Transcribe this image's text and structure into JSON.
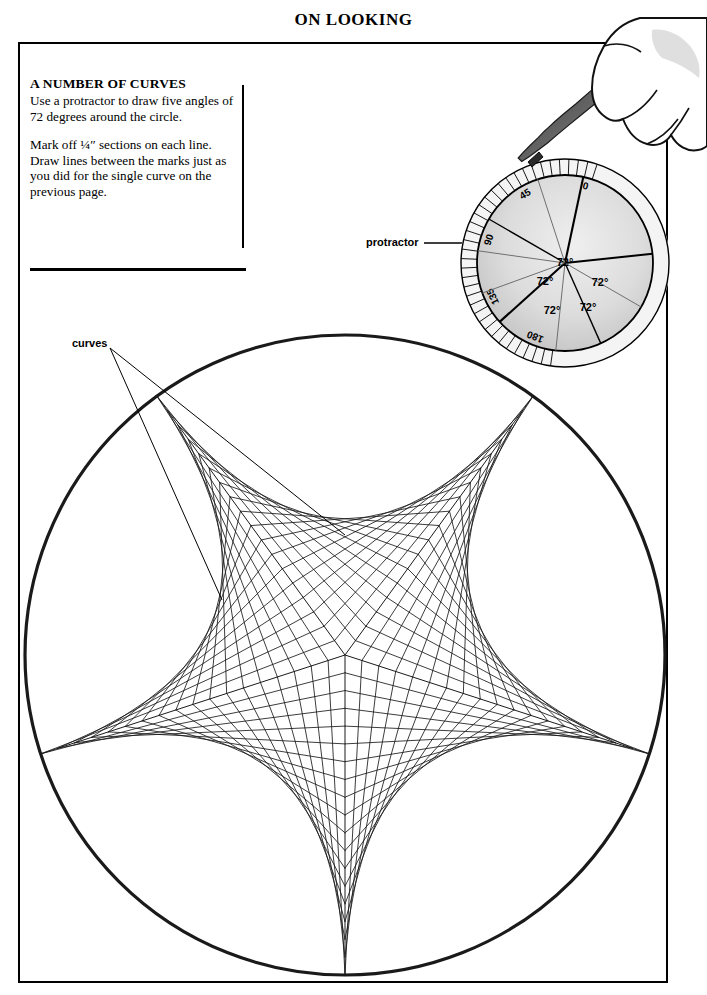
{
  "page": {
    "title": "ON LOOKING",
    "width": 707,
    "height": 995,
    "background": "#ffffff",
    "ink": "#000000"
  },
  "instruction_box": {
    "heading": "A NUMBER OF CURVES",
    "paragraph_1": "Use a protractor to draw five angles of 72 degrees around the circle.",
    "paragraph_2": "Mark off ¼″ sections on each line. Draw lines between the marks just as you did for the single curve on the previous page."
  },
  "annotations": [
    {
      "name": "protractor",
      "text": "protractor"
    },
    {
      "name": "curves",
      "text": "curves"
    }
  ],
  "protractor": {
    "center": [
      565,
      263
    ],
    "radius": 104,
    "dial_radius": 88,
    "tick_labels": [
      "0",
      "45",
      "90",
      "135",
      "180"
    ],
    "tick_label_angles_deg": [
      0,
      45,
      90,
      135,
      180
    ],
    "tick_count": 37,
    "angle_labels": [
      "72°",
      "72°",
      "72°",
      "72°",
      "72°"
    ],
    "angle_value_deg": 72,
    "sector_count": 5,
    "fill_light": "#e6e6e6",
    "fill_mid": "#d2d2d2",
    "stroke": "#000000"
  },
  "hand": {
    "name": "hand-with-pencil",
    "pencil_color": "#7a7a7a"
  },
  "chart_data": {
    "type": "scatter",
    "xlabel": "",
    "ylabel": "",
    "circle": {
      "cx": 345,
      "cy": 655,
      "r": 320
    },
    "spokes": 5,
    "angle_between_spokes_deg": 72,
    "marks_per_spoke": 18,
    "mark_spacing_label": "¼″",
    "spoke_angles_deg": [
      90,
      162,
      234,
      306,
      18
    ],
    "cusp_points": [
      [
        345,
        975
      ],
      [
        40,
        756
      ],
      [
        157,
        399
      ],
      [
        533,
        399
      ],
      [
        650,
        756
      ]
    ],
    "center_point": [
      345,
      655
    ],
    "stroke": "#1a1a1a",
    "grid": false,
    "legend": false
  }
}
